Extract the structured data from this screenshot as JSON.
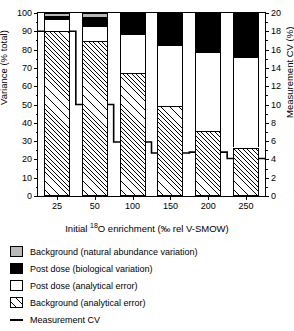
{
  "chart_data": {
    "type": "bar",
    "title": "",
    "xlabel": "Initial 18O enrichment (‰ rel V-SMOW)",
    "ylabel": "Variance (% total)",
    "ylabel_right": "Measurement CV (%)",
    "categories": [
      "25",
      "50",
      "100",
      "150",
      "200",
      "250"
    ],
    "ylim": [
      0,
      100
    ],
    "yticks": [
      0,
      10,
      20,
      30,
      40,
      50,
      60,
      70,
      80,
      90,
      100
    ],
    "ylim_right": [
      0,
      20
    ],
    "yticks_right": [
      0,
      2,
      4,
      6,
      8,
      10,
      12,
      14,
      16,
      18,
      20
    ],
    "grid": false,
    "stacked": true,
    "stack_order_bottom_to_top": [
      "Background (analytical error)",
      "Post dose (analytical error)",
      "Post dose (biological variation)",
      "Background (natural abundance variation)"
    ],
    "series": [
      {
        "name": "Background (analytical error)",
        "fill": "hatched",
        "color": "#ffffff",
        "values": [
          90.0,
          84.5,
          67.0,
          49.0,
          35.5,
          26.5
        ]
      },
      {
        "name": "Post dose (analytical error)",
        "fill": "open",
        "color": "#ffffff",
        "values": [
          6.5,
          8.5,
          21.5,
          33.5,
          43.0,
          49.5
        ]
      },
      {
        "name": "Post dose (biological variation)",
        "fill": "solid",
        "color": "#000000",
        "values": [
          2.0,
          5.0,
          11.0,
          17.0,
          21.5,
          24.0
        ]
      },
      {
        "name": "Background (natural abundance variation)",
        "fill": "solid",
        "color": "#b9b9b9",
        "values": [
          1.5,
          2.0,
          0.5,
          0.5,
          0.0,
          0.0
        ]
      }
    ],
    "line_series": {
      "name": "Measurement CV",
      "axis": "right",
      "style": "step",
      "color": "#000000",
      "values": [
        18.0,
        10.0,
        5.9,
        4.7,
        4.8,
        4.1,
        4.0
      ]
    },
    "legend": {
      "position": "below-axes",
      "entries": [
        {
          "label": "Background (natural abundance variation)",
          "swatch": "gray"
        },
        {
          "label": "Post dose (biological variation)",
          "swatch": "black"
        },
        {
          "label": "Post dose (analytical error)",
          "swatch": "white"
        },
        {
          "label": "Background (analytical error)",
          "swatch": "hatch"
        },
        {
          "label": "Measurement CV",
          "swatch": "line"
        }
      ]
    }
  },
  "axes": {
    "left_title": "Variance (% total)",
    "right_title": "Measurement CV (%)",
    "bottom_title_pre": "Initial ",
    "bottom_title_sup": "18",
    "bottom_title_post": "O enrichment (‰ rel V-SMOW)",
    "left_ticks": [
      "100",
      "90",
      "80",
      "70",
      "60",
      "50",
      "40",
      "30",
      "20",
      "10",
      "0"
    ],
    "right_ticks": [
      "20",
      "18",
      "16",
      "14",
      "12",
      "10",
      "8",
      "6",
      "4",
      "2",
      "0"
    ],
    "bottom_ticks": [
      "25",
      "50",
      "100",
      "150",
      "200",
      "250"
    ]
  },
  "legend_labels": {
    "e0": "Background (natural abundance variation)",
    "e1": "Post dose (biological variation)",
    "e2": "Post dose (analytical error)",
    "e3": "Background (analytical error)",
    "e4": "Measurement CV"
  }
}
